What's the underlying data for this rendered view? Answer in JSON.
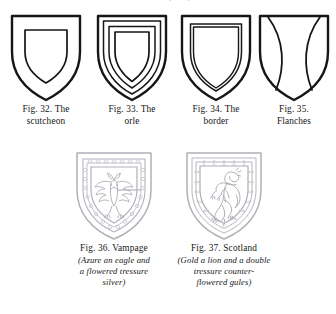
{
  "page": {
    "clipped_header_text": "·     ·            ·        ·     ( · · )",
    "background_color": "#ffffff",
    "ink_color": "#161616",
    "engraving_color": "#b6b6bc"
  },
  "figures_top": [
    {
      "id": "fig-32",
      "icon": "shield-with-inescutcheon-icon",
      "caption_lines": [
        "Fig. 32.  The",
        "scutcheon"
      ],
      "charge": "scutcheon"
    },
    {
      "id": "fig-33",
      "icon": "shield-with-orle-icon",
      "caption_lines": [
        "Fig. 33.  The",
        "orle"
      ],
      "charge": "orle"
    },
    {
      "id": "fig-34",
      "icon": "shield-with-border-icon",
      "caption_lines": [
        "Fig. 34.  The",
        "border"
      ],
      "charge": "border"
    },
    {
      "id": "fig-35",
      "icon": "shield-with-flanches-icon",
      "caption_lines": [
        "Fig. 35.",
        "Flanches"
      ],
      "charge": "flanches"
    }
  ],
  "figures_bottom": [
    {
      "id": "fig-36",
      "icon": "shield-vampage-eagle-icon",
      "title_line": "Fig. 36.  Vampage",
      "blazon_lines": [
        "(Azure an eagle and",
        "a flowered tressure",
        "silver)"
      ]
    },
    {
      "id": "fig-37",
      "icon": "shield-scotland-lion-icon",
      "title_line": "Fig. 37.  Scotland",
      "blazon_lines": [
        "(Gold a lion and a double",
        "tressure counter-",
        "flowered gules)"
      ]
    }
  ]
}
